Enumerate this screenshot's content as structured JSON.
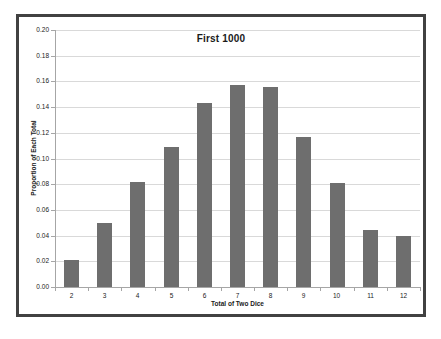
{
  "chart_data": {
    "type": "bar",
    "title": "First 1000",
    "xlabel": "Total of Two Dice",
    "ylabel": "Proportion of Each Total",
    "categories": [
      "2",
      "3",
      "4",
      "5",
      "6",
      "7",
      "8",
      "9",
      "10",
      "11",
      "12"
    ],
    "values": [
      0.021,
      0.05,
      0.082,
      0.109,
      0.143,
      0.157,
      0.156,
      0.117,
      0.081,
      0.044,
      0.04
    ],
    "ylim": [
      0.0,
      0.2
    ],
    "ytick_step": 0.02,
    "ytick_labels": [
      "0.00",
      "0.02",
      "0.04",
      "0.06",
      "0.08",
      "0.10",
      "0.12",
      "0.14",
      "0.16",
      "0.18",
      "0.20"
    ],
    "grid": true,
    "legend_position": "none",
    "colors": {
      "bar_fill": "#6e6e6e",
      "gridline": "#d9d9d9",
      "axis": "#a6a6a6",
      "text": "#1a1a1a",
      "frame_border": "#414141",
      "background": "#ffffff"
    }
  }
}
